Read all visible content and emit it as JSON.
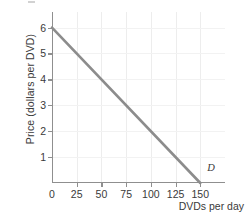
{
  "chart_data": {
    "type": "line",
    "title": "",
    "subtitle": "",
    "xlabel": "DVDs per day",
    "ylabel": "Price (dollars per DVD)",
    "xlim": [
      0,
      175
    ],
    "ylim": [
      0,
      6.6
    ],
    "xticks": [
      0,
      25,
      50,
      75,
      100,
      125,
      150
    ],
    "xtick_labels": [
      "0",
      "25",
      "50",
      "75",
      "100",
      "125",
      "150"
    ],
    "yticks": [
      1,
      2,
      3,
      4,
      5,
      6
    ],
    "ytick_labels": [
      "1",
      "2",
      "3",
      "4",
      "5",
      "6"
    ],
    "grid": "vertical-and-faint-horizontal",
    "legend": "inline-annotation",
    "series": [
      {
        "name": "D",
        "label": "D",
        "kind": "demand-curve",
        "color": "#8c8c8c",
        "x": [
          0,
          150
        ],
        "y": [
          6,
          0
        ],
        "points": [
          {
            "x": 0,
            "y": 6
          },
          {
            "x": 25,
            "y": 5
          },
          {
            "x": 50,
            "y": 4
          },
          {
            "x": 75,
            "y": 3
          },
          {
            "x": 100,
            "y": 2
          },
          {
            "x": 125,
            "y": 1
          },
          {
            "x": 150,
            "y": 0
          }
        ]
      }
    ],
    "annotations": [
      {
        "text": "D",
        "x": 157,
        "y": 0.55,
        "style": "italic"
      }
    ]
  },
  "colors": {
    "background": "#ffffff",
    "axis": "#8f8f8f",
    "grid_vertical": "#ededed",
    "grid_horizontal": "#f2f2f2",
    "series": "#8c8c8c",
    "text": "#3a3a3a"
  }
}
